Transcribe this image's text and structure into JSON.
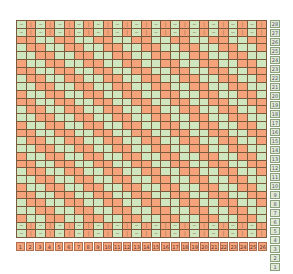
{
  "chart": {
    "type": "knitting-chart",
    "columns": 26,
    "rows": 28,
    "colors": {
      "knit": "#f4a37a",
      "purl": "#cfe6bf",
      "border": "#7a5a3c"
    },
    "symbols": {
      "knit": "|",
      "purl": "−"
    },
    "row_numbers": [
      28,
      27,
      26,
      25,
      24,
      23,
      22,
      21,
      20,
      19,
      18,
      17,
      16,
      15,
      14,
      13,
      12,
      11,
      10,
      9,
      8,
      7,
      6,
      5,
      4,
      3,
      2,
      1
    ],
    "column_numbers": [
      1,
      2,
      3,
      4,
      5,
      6,
      7,
      8,
      9,
      10,
      11,
      12,
      13,
      14,
      15,
      16,
      17,
      18,
      19,
      20,
      21,
      22,
      23,
      24,
      25,
      26
    ]
  }
}
